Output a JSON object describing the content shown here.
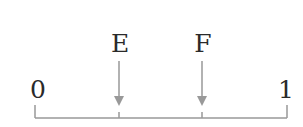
{
  "diagram": {
    "type": "number-line",
    "colors": {
      "line": "#999999",
      "arrow": "#999999",
      "text": "#2a2a2a"
    },
    "endpoints": {
      "start_label": "0",
      "end_label": "1"
    },
    "points": [
      {
        "label": "E",
        "position": 0.333
      },
      {
        "label": "F",
        "position": 0.667
      }
    ]
  }
}
